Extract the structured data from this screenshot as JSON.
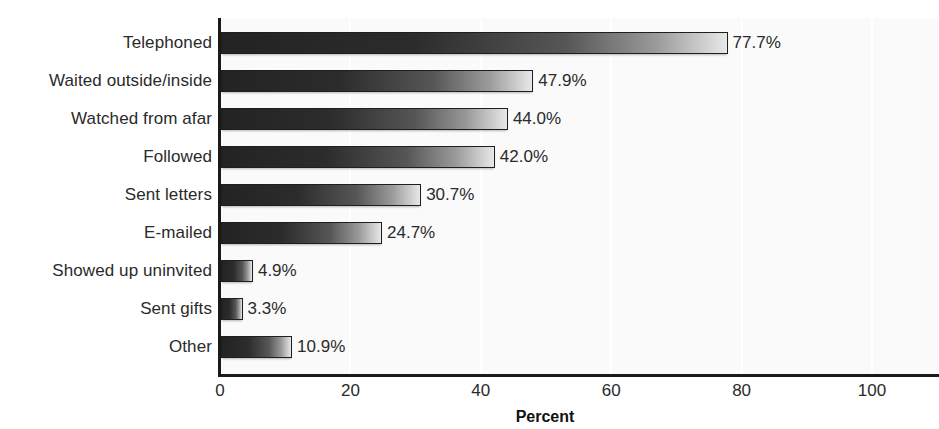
{
  "chart_data": {
    "type": "bar",
    "orientation": "horizontal",
    "title": "",
    "subtitle": "",
    "xlabel": "Percent",
    "ylabel": "",
    "xlim": [
      0,
      100
    ],
    "grid": true,
    "legend": false,
    "xticks": [
      "0",
      "20",
      "40",
      "60",
      "80",
      "100"
    ],
    "xtick_values": [
      0,
      20,
      40,
      60,
      80,
      100
    ],
    "categories": [
      "Telephoned",
      "Waited outside/inside",
      "Watched from afar",
      "Followed",
      "Sent letters",
      "E-mailed",
      "Showed up uninvited",
      "Sent gifts",
      "Other"
    ],
    "values": [
      77.7,
      47.9,
      44.0,
      42.0,
      30.7,
      24.7,
      4.9,
      3.3,
      10.9
    ],
    "data_labels": [
      "77.7%",
      "47.9%",
      "44.0%",
      "42.0%",
      "30.7%",
      "24.7%",
      "4.9%",
      "3.3%",
      "10.9%"
    ],
    "bar_style": {
      "fill": "gradient",
      "gradient_from": "#232323",
      "gradient_to": "#e8e8e8",
      "border": "#1f1f1f"
    },
    "plot_background": "#fafafa",
    "axis_color": "#1a1a1a",
    "gridline_color": "#ffffff"
  }
}
